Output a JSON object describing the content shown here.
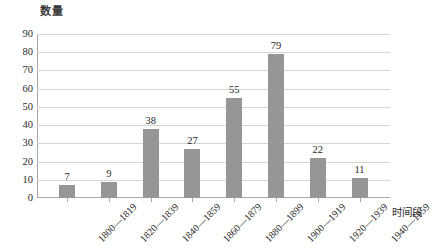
{
  "chart_data": {
    "type": "bar",
    "title": "",
    "ylabel": "数量",
    "xlabel": "时间段",
    "categories": [
      "1800—1819",
      "1820—1839",
      "1840—1859",
      "1860—1879",
      "1880—1899",
      "1900—1919",
      "1920—1939",
      "1940—1959"
    ],
    "values": [
      7,
      9,
      38,
      27,
      55,
      79,
      22,
      11
    ],
    "data_labels": [
      "7",
      "9",
      "38",
      "27",
      "55",
      "79",
      "22",
      "11"
    ],
    "ylim": [
      0,
      90
    ],
    "ytick_step": 10,
    "yticks": [
      "90",
      "80",
      "70",
      "60",
      "50",
      "40",
      "30",
      "20",
      "10",
      "0"
    ],
    "grid": true,
    "legend": false,
    "bar_color": "#969696",
    "gridline_color": "#d4d4d4",
    "axis_color": "#a8a8a8",
    "text_color": "#2b2b2b"
  }
}
